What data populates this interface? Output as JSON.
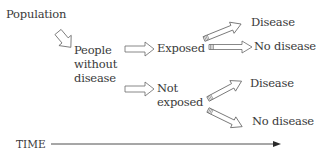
{
  "diagram": {
    "type": "cohort-study-flow",
    "nodes": {
      "population": "Population",
      "people_without_disease": [
        "People",
        "without",
        "disease"
      ],
      "exposed": "Exposed",
      "not_exposed": [
        "Not",
        "exposed"
      ],
      "exposed_disease": "Disease",
      "exposed_no_disease": "No disease",
      "not_exposed_disease": "Disease",
      "not_exposed_no_disease": "No disease"
    },
    "edges": [
      {
        "from": "population",
        "to": "people_without_disease"
      },
      {
        "from": "people_without_disease",
        "to": "exposed"
      },
      {
        "from": "people_without_disease",
        "to": "not_exposed"
      },
      {
        "from": "exposed",
        "to": "exposed_disease"
      },
      {
        "from": "exposed",
        "to": "exposed_no_disease"
      },
      {
        "from": "not_exposed",
        "to": "not_exposed_disease"
      },
      {
        "from": "not_exposed",
        "to": "not_exposed_no_disease"
      }
    ],
    "time_axis": {
      "label": "TIME",
      "direction": "left-to-right"
    },
    "colors": {
      "text": "#3a3a3a",
      "arrow_stroke": "#6a6a6a",
      "background": "#ffffff"
    }
  }
}
